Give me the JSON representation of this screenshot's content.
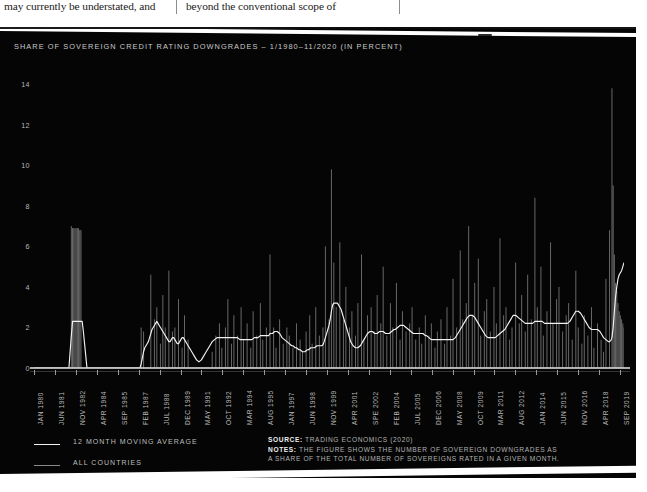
{
  "document_text": {
    "left_column": "may currently be understated, and",
    "right_column": "beyond the conventional scope of"
  },
  "figure": {
    "title": "SHARE OF SOVEREIGN CREDIT RATING DOWNGRADES – 1/1980–11/2020 (IN PERCENT)",
    "background_color": "#050505",
    "text_color": "#c9c9c9",
    "series_colors": {
      "moving_average": "#f2f2f2",
      "all_countries": "#8a8a8a"
    },
    "legend": [
      {
        "label": "12 MONTH MOVING AVERAGE",
        "key": "moving_average"
      },
      {
        "label": "ALL COUNTRIES",
        "key": "all_countries"
      }
    ],
    "source_label": "SOURCE:",
    "source_value": "TRADING ECONOMICS (2020)",
    "notes_label": "NOTES:",
    "notes_line_1": "THE FIGURE SHOWS THE NUMBER OF SOVEREIGN DOWNGRADES AS",
    "notes_line_2": "A SHARE OF THE TOTAL NUMBER OF SOVEREIGNS RATED IN A GIVEN MONTH."
  },
  "chart_data": {
    "type": "line",
    "title": "SHARE OF SOVEREIGN CREDIT RATING DOWNGRADES – 1/1980–11/2020 (IN PERCENT)",
    "xlabel": "",
    "ylabel": "",
    "ylim": [
      0,
      14.8
    ],
    "yticks": [
      0,
      2,
      4,
      6,
      8,
      10,
      12,
      14
    ],
    "grid": false,
    "legend_position": "bottom-left",
    "xtick_labels": [
      "JAN 1980",
      "JUN 1981",
      "NOV 1982",
      "APR 1984",
      "SEP 1985",
      "FEB 1987",
      "JUL 1988",
      "DEC 1989",
      "MAY 1991",
      "OCT 1992",
      "MAR 1994",
      "AUG 1995",
      "JAN 1997",
      "JUN 1998",
      "NOV 1999",
      "APR 2001",
      "SPE 2002",
      "FEB 2004",
      "JUL 2005",
      "DEC 2006",
      "MAY 2008",
      "OCT 2009",
      "MAR 2011",
      "AUG 2012",
      "JAN 2014",
      "JUN 2015",
      "NOV 2016",
      "APR 2018",
      "SEP 2019"
    ],
    "x_start": "1980-01",
    "x_end": "2020-11",
    "n_points": 491,
    "series": [
      {
        "name": "ALL COUNTRIES",
        "color": "#8a8a8a",
        "description": "Monthly share of sovereign credit rating downgrades, in percent. Sparse/zero through the early 1980s apart from a 1982-83 episode near 7; dense volatile spikes from 1987 onward reaching ~6-10 in 1998, ~8 in 2008-09, ~8.5 in 2015-16 and a maximum near 13.8 in 2020.",
        "values": [
          0,
          0,
          0,
          0,
          0,
          0,
          0,
          0,
          0,
          0,
          0,
          0,
          0,
          0,
          0,
          0,
          0,
          0,
          0,
          0,
          0,
          0,
          0,
          0,
          0,
          0,
          0,
          0,
          0,
          0,
          0,
          7.0,
          6.9,
          6.9,
          6.9,
          6.9,
          6.9,
          6.9,
          6.8,
          6.8,
          0,
          0,
          0,
          0,
          0,
          0,
          0,
          0,
          0,
          0,
          0,
          0,
          0,
          0,
          0,
          0,
          0,
          0,
          0,
          0,
          0,
          0,
          0,
          0,
          0,
          0,
          0,
          0,
          0,
          0,
          0,
          0,
          0,
          0,
          0,
          0,
          0,
          0,
          0,
          0,
          0,
          0,
          0,
          0,
          0,
          0,
          0,
          0,
          0,
          2.0,
          0,
          1.8,
          0,
          0,
          0,
          0,
          0,
          4.6,
          0,
          0,
          2.4,
          0,
          3.0,
          0,
          0,
          1.2,
          0,
          3.6,
          0,
          2.0,
          0,
          0,
          4.8,
          0,
          0,
          1.8,
          0,
          2.0,
          0,
          0,
          3.4,
          0,
          0,
          1.0,
          0,
          2.6,
          0,
          0,
          1.4,
          0,
          0,
          0,
          0,
          0,
          0,
          0,
          0,
          0,
          0,
          0,
          0,
          0,
          0,
          0,
          0,
          0,
          0,
          0,
          0.8,
          0,
          0,
          1.6,
          0,
          0,
          2.2,
          0,
          1.0,
          0,
          0,
          2.0,
          0,
          3.4,
          0,
          0,
          1.2,
          0,
          2.6,
          0,
          0,
          1.6,
          0,
          0,
          3.0,
          0,
          1.4,
          0,
          0,
          2.2,
          0,
          0,
          1.0,
          0,
          2.8,
          0,
          0,
          1.6,
          0,
          0,
          3.2,
          0,
          1.4,
          0,
          0,
          2.0,
          0,
          0,
          5.6,
          0,
          0,
          2.0,
          0,
          1.0,
          0,
          0,
          2.4,
          0,
          0,
          1.2,
          0,
          0,
          2.0,
          0,
          1.6,
          0,
          0,
          1.0,
          0,
          0,
          2.2,
          0,
          0,
          1.4,
          0,
          0.8,
          0,
          0,
          1.8,
          0,
          0,
          2.6,
          0,
          1.2,
          0,
          0,
          3.0,
          0,
          0,
          1.6,
          0,
          0,
          2.0,
          0,
          6.0,
          0,
          0,
          2.4,
          0,
          9.8,
          0,
          5.2,
          0,
          3.0,
          0,
          0,
          6.2,
          0,
          0,
          2.4,
          0,
          4.0,
          0,
          0,
          2.0,
          0,
          2.8,
          0,
          0,
          1.6,
          0,
          3.2,
          0,
          0,
          5.6,
          0,
          1.4,
          0,
          0,
          2.6,
          0,
          0,
          3.0,
          0,
          0,
          1.8,
          0,
          3.6,
          0,
          0,
          2.2,
          0,
          5.0,
          0,
          0,
          1.6,
          0,
          0,
          3.2,
          0,
          2.0,
          0,
          0,
          4.2,
          0,
          0,
          1.4,
          0,
          2.8,
          0,
          0,
          1.8,
          0,
          0,
          2.2,
          0,
          3.0,
          0,
          0,
          1.4,
          0,
          0,
          2.0,
          0,
          1.2,
          0,
          0,
          2.6,
          0,
          0,
          1.6,
          0,
          2.2,
          0,
          0,
          1.0,
          0,
          1.8,
          0,
          0,
          2.4,
          0,
          0,
          1.2,
          0,
          3.0,
          0,
          0,
          1.6,
          0,
          4.4,
          0,
          0,
          2.0,
          0,
          0,
          5.8,
          0,
          2.4,
          0,
          0,
          3.2,
          0,
          7.0,
          0,
          0,
          2.6,
          0,
          4.2,
          0,
          0,
          5.4,
          0,
          1.6,
          0,
          0,
          2.8,
          0,
          3.4,
          0,
          0,
          1.8,
          0,
          0,
          4.0,
          0,
          2.2,
          0,
          0,
          6.4,
          0,
          0,
          2.6,
          0,
          3.0,
          0,
          0,
          1.4,
          0,
          2.0,
          0,
          0,
          5.2,
          0,
          0,
          2.2,
          0,
          3.6,
          0,
          0,
          1.8,
          0,
          4.6,
          0,
          0,
          2.4,
          0,
          0,
          8.4,
          0,
          3.0,
          0,
          0,
          5.0,
          0,
          1.6,
          0,
          0,
          2.8,
          0,
          0,
          6.2,
          0,
          2.2,
          0,
          0,
          3.4,
          0,
          4.0,
          0,
          0,
          1.8,
          0,
          0,
          2.6,
          0,
          3.2,
          0,
          0,
          1.4,
          0,
          0,
          4.8,
          0,
          2.0,
          0,
          0,
          1.2,
          0,
          2.6,
          0,
          0,
          1.6,
          0,
          0,
          3.0,
          0,
          1.0,
          0,
          0,
          2.2,
          0,
          0,
          1.4,
          0,
          0.8,
          0,
          4.4,
          0,
          0,
          6.8,
          0,
          13.8,
          9.0,
          5.6,
          4.2,
          3.8,
          3.2,
          2.8,
          2.6,
          2.4,
          2.2,
          2.0
        ]
      },
      {
        "name": "12 MONTH MOVING AVERAGE",
        "color": "#f2f2f2",
        "description": "12-month moving average of the monthly downgrade share. Flat at 0 until 1982, plateau at ~2.3 through 1982-84, then ~1.1-2.0 band 1987-1997, peak ~3.2 in 1998-99, ~1.0-2.5 range in the 2000s, ~2.6 around 2009, ~2.8 in 2015-16, dipping to ~1.3 in 2019 and rising sharply to ~5.2 at end-2020.",
        "values": [
          0,
          0,
          0,
          0,
          0,
          0,
          0,
          0,
          0,
          0,
          0,
          0,
          0,
          0,
          0,
          0,
          0,
          0,
          0,
          0,
          0,
          0,
          0,
          0,
          0,
          0,
          0,
          0,
          0,
          0,
          0.8,
          1.6,
          2.3,
          2.3,
          2.3,
          2.3,
          2.3,
          2.3,
          2.3,
          2.3,
          2.3,
          1.8,
          1.2,
          0.6,
          0,
          0,
          0,
          0,
          0,
          0,
          0,
          0,
          0,
          0,
          0,
          0,
          0,
          0,
          0,
          0,
          0,
          0,
          0,
          0,
          0,
          0,
          0,
          0,
          0,
          0,
          0,
          0,
          0,
          0,
          0,
          0,
          0,
          0,
          0,
          0,
          0,
          0,
          0,
          0,
          0,
          0,
          0,
          0,
          0,
          0.2,
          0.5,
          0.8,
          1.0,
          1.1,
          1.2,
          1.3,
          1.5,
          1.7,
          1.9,
          2.0,
          2.1,
          2.2,
          2.3,
          2.2,
          2.1,
          2.0,
          1.9,
          1.8,
          1.7,
          1.6,
          1.5,
          1.4,
          1.3,
          1.3,
          1.4,
          1.5,
          1.5,
          1.4,
          1.3,
          1.2,
          1.2,
          1.3,
          1.4,
          1.5,
          1.5,
          1.4,
          1.3,
          1.2,
          1.1,
          1.0,
          0.9,
          0.8,
          0.7,
          0.6,
          0.5,
          0.4,
          0.35,
          0.3,
          0.35,
          0.4,
          0.5,
          0.6,
          0.7,
          0.8,
          0.9,
          1.0,
          1.1,
          1.2,
          1.3,
          1.35,
          1.4,
          1.45,
          1.5,
          1.5,
          1.5,
          1.5,
          1.5,
          1.5,
          1.5,
          1.5,
          1.5,
          1.5,
          1.5,
          1.5,
          1.5,
          1.5,
          1.5,
          1.5,
          1.5,
          1.5,
          1.45,
          1.4,
          1.4,
          1.4,
          1.4,
          1.4,
          1.4,
          1.4,
          1.4,
          1.4,
          1.4,
          1.4,
          1.45,
          1.5,
          1.5,
          1.5,
          1.5,
          1.55,
          1.6,
          1.6,
          1.6,
          1.6,
          1.6,
          1.6,
          1.6,
          1.6,
          1.7,
          1.7,
          1.7,
          1.75,
          1.8,
          1.8,
          1.8,
          1.75,
          1.7,
          1.6,
          1.5,
          1.45,
          1.4,
          1.35,
          1.3,
          1.25,
          1.2,
          1.15,
          1.1,
          1.1,
          1.05,
          1.0,
          1.0,
          0.95,
          0.9,
          0.9,
          0.85,
          0.8,
          0.8,
          0.8,
          0.85,
          0.9,
          0.9,
          0.95,
          1.0,
          1.0,
          1.0,
          1.0,
          1.05,
          1.1,
          1.1,
          1.1,
          1.1,
          1.1,
          1.15,
          1.3,
          1.5,
          1.7,
          1.9,
          2.1,
          2.4,
          2.8,
          3.1,
          3.2,
          3.2,
          3.2,
          3.2,
          3.1,
          3.0,
          2.9,
          2.7,
          2.5,
          2.3,
          2.1,
          1.9,
          1.7,
          1.5,
          1.3,
          1.2,
          1.1,
          1.05,
          1.0,
          1.0,
          1.0,
          1.05,
          1.1,
          1.2,
          1.3,
          1.4,
          1.5,
          1.6,
          1.7,
          1.75,
          1.8,
          1.8,
          1.8,
          1.75,
          1.7,
          1.7,
          1.7,
          1.75,
          1.8,
          1.8,
          1.8,
          1.8,
          1.75,
          1.7,
          1.7,
          1.7,
          1.7,
          1.75,
          1.8,
          1.85,
          1.9,
          1.9,
          1.95,
          2.0,
          2.05,
          2.1,
          2.1,
          2.1,
          2.1,
          2.05,
          2.0,
          1.95,
          1.9,
          1.85,
          1.8,
          1.75,
          1.7,
          1.7,
          1.7,
          1.7,
          1.7,
          1.7,
          1.7,
          1.7,
          1.7,
          1.65,
          1.6,
          1.6,
          1.55,
          1.5,
          1.45,
          1.4,
          1.4,
          1.4,
          1.4,
          1.4,
          1.4,
          1.4,
          1.4,
          1.4,
          1.4,
          1.4,
          1.4,
          1.4,
          1.4,
          1.4,
          1.4,
          1.4,
          1.4,
          1.4,
          1.45,
          1.5,
          1.6,
          1.7,
          1.8,
          1.9,
          2.0,
          2.1,
          2.2,
          2.3,
          2.4,
          2.5,
          2.55,
          2.6,
          2.6,
          2.6,
          2.55,
          2.5,
          2.4,
          2.3,
          2.2,
          2.1,
          2.0,
          1.9,
          1.8,
          1.7,
          1.6,
          1.55,
          1.5,
          1.5,
          1.5,
          1.5,
          1.5,
          1.5,
          1.5,
          1.55,
          1.6,
          1.65,
          1.7,
          1.75,
          1.8,
          1.85,
          1.9,
          2.0,
          2.1,
          2.2,
          2.3,
          2.4,
          2.5,
          2.6,
          2.6,
          2.6,
          2.55,
          2.5,
          2.45,
          2.4,
          2.35,
          2.3,
          2.25,
          2.2,
          2.2,
          2.2,
          2.2,
          2.2,
          2.2,
          2.2,
          2.25,
          2.3,
          2.3,
          2.3,
          2.3,
          2.3,
          2.3,
          2.3,
          2.25,
          2.2,
          2.2,
          2.2,
          2.2,
          2.2,
          2.2,
          2.2,
          2.2,
          2.2,
          2.2,
          2.2,
          2.2,
          2.2,
          2.2,
          2.2,
          2.2,
          2.2,
          2.2,
          2.2,
          2.2,
          2.25,
          2.3,
          2.4,
          2.5,
          2.6,
          2.7,
          2.8,
          2.8,
          2.8,
          2.75,
          2.7,
          2.6,
          2.5,
          2.4,
          2.3,
          2.2,
          2.1,
          2.0,
          1.95,
          1.9,
          1.9,
          1.9,
          1.9,
          1.9,
          1.9,
          1.85,
          1.8,
          1.7,
          1.6,
          1.5,
          1.45,
          1.4,
          1.35,
          1.3,
          1.3,
          1.35,
          1.5,
          2.0,
          2.8,
          3.5,
          4.0,
          4.4,
          4.6,
          4.7,
          4.8,
          5.0,
          5.2
        ]
      }
    ]
  }
}
